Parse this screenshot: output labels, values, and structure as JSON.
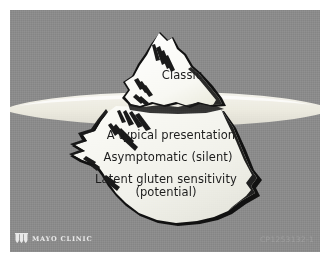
{
  "figure": {
    "kind": "iceberg-diagram",
    "background_color": "#8b8b8b",
    "plate_border_color": "#ffffff",
    "ice_fill_above": "#fdfdfb",
    "ice_fill_below": "#f0f0ea",
    "ice_outline": "#151515",
    "water_color": "#ebeae2",
    "text_color": "#1d1d1d"
  },
  "labels": {
    "above_water": [
      {
        "id": "classic",
        "text": "Classic"
      }
    ],
    "below_water": [
      {
        "id": "atypical",
        "text": "A typical presentation"
      },
      {
        "id": "asymptomatic",
        "text": "Asymptomatic (silent)"
      },
      {
        "id": "latent_line1",
        "text": "Latent gluten sensitivity"
      },
      {
        "id": "latent_line2",
        "text": "(potential)"
      }
    ]
  },
  "branding": {
    "shield_icon": "mayo-clinic-shield-icon",
    "wordmark": "MAYO CLINIC",
    "wordmark_color": "#e9e9e9"
  },
  "watermark": {
    "code": "CP1253132-1",
    "color": "#a0a0a0"
  }
}
